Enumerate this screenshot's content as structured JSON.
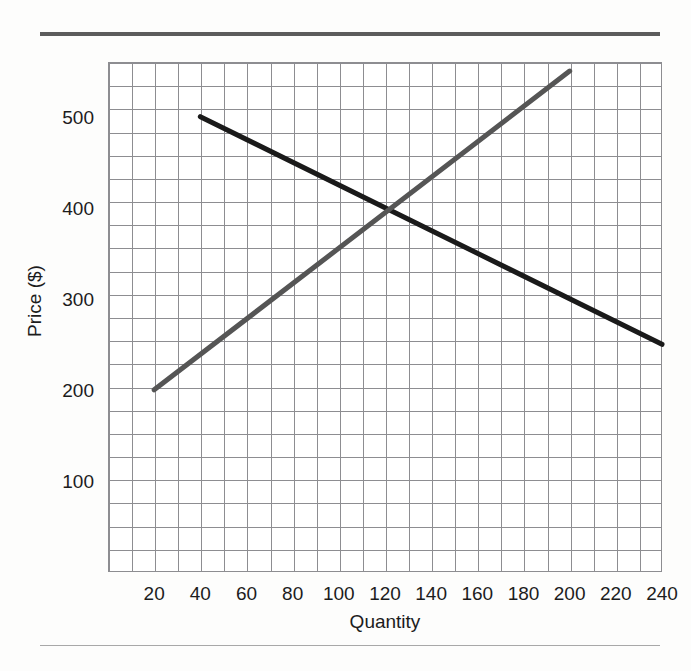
{
  "page": {
    "background_color": "#fdfdfc",
    "rule_top_color": "#5c5c5c",
    "rule_bottom_color": "#a8a8a8"
  },
  "chart_data": {
    "type": "line",
    "title": "",
    "subtitle": "",
    "xlabel": "Quantity",
    "ylabel": "Price ($)",
    "xlim": [
      0,
      240
    ],
    "ylim": [
      0,
      560
    ],
    "xticks": [
      20,
      40,
      60,
      80,
      100,
      120,
      140,
      160,
      180,
      200,
      220,
      240
    ],
    "xtick_labels": [
      "20",
      "40",
      "60",
      "80",
      "100",
      "120",
      "140",
      "160",
      "180",
      "200",
      "220",
      "240"
    ],
    "yticks": [
      100,
      200,
      300,
      400,
      500
    ],
    "ytick_labels": [
      "100",
      "200",
      "300",
      "400",
      "500"
    ],
    "grid": true,
    "grid_x_step": 10,
    "grid_y_step": 25,
    "grid_color": "#8d8d91",
    "plot_background": "#ffffff",
    "legend": null,
    "legend_position": "none",
    "annotations": [],
    "series": [
      {
        "name": "Demand",
        "color": "#1a1a1a",
        "line_width": 5,
        "x": [
          40,
          240
        ],
        "y": [
          500,
          250
        ],
        "slope": -1.25,
        "intercept": 550
      },
      {
        "name": "Supply",
        "color": "#555555",
        "line_width": 5,
        "x": [
          20,
          200
        ],
        "y": [
          200,
          550
        ],
        "slope": 1.9444,
        "intercept": 161.11
      }
    ],
    "equilibrium": {
      "quantity": 120,
      "price": 400
    }
  }
}
